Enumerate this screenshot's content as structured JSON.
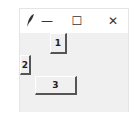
{
  "window": {
    "title": "",
    "controls": {
      "minimize_glyph": "—",
      "maximize_glyph": "☐",
      "close_glyph": "✕"
    }
  },
  "buttons": [
    {
      "label": "1"
    },
    {
      "label": "2"
    },
    {
      "label": "3"
    }
  ],
  "colors": {
    "background": "#f0f0f0",
    "titlebar": "#ffffff",
    "button_shadow": "#555555"
  }
}
